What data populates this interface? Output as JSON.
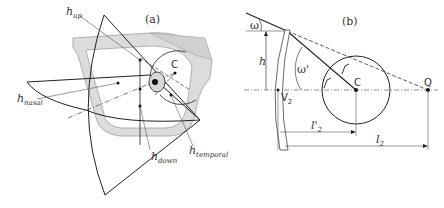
{
  "figure": {
    "panel_a": {
      "label": "(a)",
      "labels": {
        "h_up": {
          "base": "h",
          "sub": "up"
        },
        "h_nasal": {
          "base": "h",
          "sub": "nasal"
        },
        "h_down": {
          "base": "h",
          "sub": "down"
        },
        "h_temporal": {
          "base": "h",
          "sub": "temporal"
        },
        "C": "C"
      }
    },
    "panel_b": {
      "label": "(b)",
      "labels": {
        "omega": "ω",
        "omega_prime": "ω'",
        "h": "h",
        "V2": {
          "base": "V",
          "sub": "2"
        },
        "C": "C",
        "Q": "Q",
        "l2_prime": {
          "base": "l'",
          "sub": "2"
        },
        "l2": {
          "base": "l",
          "sub": "2"
        }
      }
    },
    "colors": {
      "line": "#222222",
      "frame_fill": "#dcdcdc",
      "frame_stroke": "#a0a0a0",
      "lens_fill": "#d8d8d8",
      "thin_line": "#555555"
    }
  }
}
